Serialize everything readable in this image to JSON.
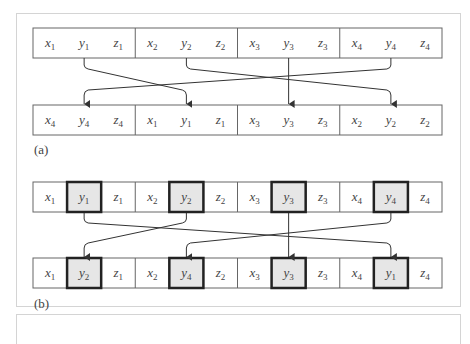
{
  "figure": {
    "part_a": {
      "label": "(a)",
      "top_row": [
        {
          "group": 1,
          "cells": [
            {
              "v": "x",
              "s": "1"
            },
            {
              "v": "y",
              "s": "1"
            },
            {
              "v": "z",
              "s": "1"
            }
          ]
        },
        {
          "group": 2,
          "cells": [
            {
              "v": "x",
              "s": "2"
            },
            {
              "v": "y",
              "s": "2"
            },
            {
              "v": "z",
              "s": "2"
            }
          ]
        },
        {
          "group": 3,
          "cells": [
            {
              "v": "x",
              "s": "3"
            },
            {
              "v": "y",
              "s": "3"
            },
            {
              "v": "z",
              "s": "3"
            }
          ]
        },
        {
          "group": 4,
          "cells": [
            {
              "v": "x",
              "s": "4"
            },
            {
              "v": "y",
              "s": "4"
            },
            {
              "v": "z",
              "s": "4"
            }
          ]
        }
      ],
      "bottom_row": [
        {
          "group": 4,
          "cells": [
            {
              "v": "x",
              "s": "4"
            },
            {
              "v": "y",
              "s": "4"
            },
            {
              "v": "z",
              "s": "4"
            }
          ]
        },
        {
          "group": 1,
          "cells": [
            {
              "v": "x",
              "s": "1"
            },
            {
              "v": "y",
              "s": "1"
            },
            {
              "v": "z",
              "s": "1"
            }
          ]
        },
        {
          "group": 3,
          "cells": [
            {
              "v": "x",
              "s": "3"
            },
            {
              "v": "y",
              "s": "3"
            },
            {
              "v": "z",
              "s": "3"
            }
          ]
        },
        {
          "group": 2,
          "cells": [
            {
              "v": "x",
              "s": "2"
            },
            {
              "v": "y",
              "s": "2"
            },
            {
              "v": "z",
              "s": "2"
            }
          ]
        }
      ],
      "arrows": [
        {
          "from_group": 1,
          "to_position": 2
        },
        {
          "from_group": 2,
          "to_position": 4
        },
        {
          "from_group": 3,
          "to_position": 3
        },
        {
          "from_group": 4,
          "to_position": 1
        }
      ]
    },
    "part_b": {
      "label": "(b)",
      "top_row": [
        {
          "v": "x",
          "s": "1",
          "hl": false
        },
        {
          "v": "y",
          "s": "1",
          "hl": true
        },
        {
          "v": "z",
          "s": "1",
          "hl": false
        },
        {
          "v": "x",
          "s": "2",
          "hl": false
        },
        {
          "v": "y",
          "s": "2",
          "hl": true
        },
        {
          "v": "z",
          "s": "2",
          "hl": false
        },
        {
          "v": "x",
          "s": "3",
          "hl": false
        },
        {
          "v": "y",
          "s": "3",
          "hl": true
        },
        {
          "v": "z",
          "s": "3",
          "hl": false
        },
        {
          "v": "x",
          "s": "4",
          "hl": false
        },
        {
          "v": "y",
          "s": "4",
          "hl": true
        },
        {
          "v": "z",
          "s": "4",
          "hl": false
        }
      ],
      "bottom_row": [
        {
          "v": "x",
          "s": "1",
          "hl": false
        },
        {
          "v": "y",
          "s": "2",
          "hl": true
        },
        {
          "v": "z",
          "s": "1",
          "hl": false
        },
        {
          "v": "x",
          "s": "2",
          "hl": false
        },
        {
          "v": "y",
          "s": "4",
          "hl": true
        },
        {
          "v": "z",
          "s": "2",
          "hl": false
        },
        {
          "v": "x",
          "s": "3",
          "hl": false
        },
        {
          "v": "y",
          "s": "3",
          "hl": true
        },
        {
          "v": "z",
          "s": "3",
          "hl": false
        },
        {
          "v": "x",
          "s": "4",
          "hl": false
        },
        {
          "v": "y",
          "s": "1",
          "hl": true
        },
        {
          "v": "z",
          "s": "4",
          "hl": false
        }
      ],
      "arrows": [
        {
          "from_cell": 1,
          "to_cell": 10
        },
        {
          "from_cell": 4,
          "to_cell": 1
        },
        {
          "from_cell": 7,
          "to_cell": 7
        },
        {
          "from_cell": 10,
          "to_cell": 4
        }
      ]
    },
    "colors": {
      "border": "#666666",
      "highlight_border": "#222222",
      "highlight_fill": "#e6e6e6",
      "arrow": "#333333",
      "panel_border": "#d4d4d4"
    }
  }
}
